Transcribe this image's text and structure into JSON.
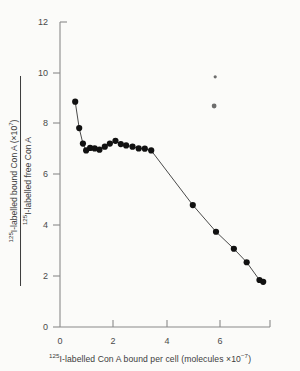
{
  "chart_data": {
    "type": "scatter",
    "title": "",
    "subtitle": "",
    "xlabel_parts": {
      "sup_isotope": "125",
      "text": "I-labelled Con A bound per cell (molecules ×10",
      "sup_exponent": "−7",
      "tail": ")"
    },
    "ylabel_numerator_parts": {
      "sup_isotope": "125",
      "text": "I-labelled bound Con A (×10",
      "sup_exponent": "7",
      "tail": ")"
    },
    "ylabel_denominator_parts": {
      "sup_isotope": "125",
      "text": "I-labelled free Con A"
    },
    "xlabel": "125I-labelled Con A bound per cell (molecules ×10−7)",
    "ylabel": "125I-labelled bound Con A (×107) / 125I-labelled free Con A",
    "xlim": [
      0,
      7.9
    ],
    "ylim": [
      0,
      12
    ],
    "xticks": [
      0,
      2,
      4,
      6
    ],
    "yticks": [
      0,
      2,
      4,
      6,
      8,
      10,
      12
    ],
    "xtick_labels": [
      "0",
      "2",
      "4",
      "6"
    ],
    "ytick_labels": [
      "0",
      "2",
      "4",
      "6",
      "8",
      "10",
      "12"
    ],
    "grid": false,
    "legend": null,
    "series": [
      {
        "name": "Scatchard binding curve",
        "marker": "filled-circle",
        "connected": true,
        "color": "#111111",
        "x": [
          0.57,
          0.72,
          0.86,
          0.98,
          1.13,
          1.3,
          1.48,
          1.68,
          1.87,
          2.08,
          2.28,
          2.48,
          2.72,
          2.95,
          3.18,
          3.42,
          4.98,
          5.85,
          6.52,
          7.0,
          7.48,
          7.62
        ],
        "y": [
          8.87,
          7.83,
          7.22,
          6.95,
          7.05,
          7.03,
          6.98,
          7.1,
          7.22,
          7.33,
          7.2,
          7.15,
          7.1,
          7.03,
          7.02,
          6.95,
          4.8,
          3.75,
          3.08,
          2.55,
          1.85,
          1.78
        ]
      }
    ],
    "artifacts": [
      {
        "name": "scan-speck-upper",
        "x": 5.82,
        "y": 9.85
      },
      {
        "name": "scan-speck-lower",
        "x": 5.78,
        "y": 8.7
      }
    ],
    "axis_color": "#8a8a8a",
    "line_color": "#4a4a4a",
    "point_color": "#111111",
    "background_color": "#fbfbf9"
  }
}
